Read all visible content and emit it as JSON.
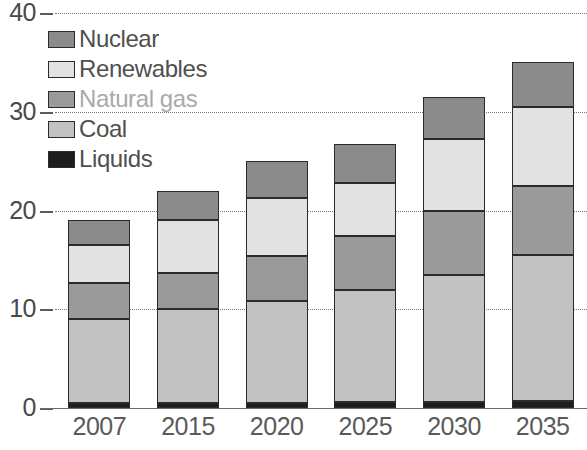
{
  "chart_data": {
    "type": "bar",
    "stacked": true,
    "title": "",
    "subtitle": "",
    "xlabel": "",
    "ylabel": "",
    "categories": [
      "2007",
      "2015",
      "2020",
      "2025",
      "2030",
      "2035"
    ],
    "ylim": [
      0,
      40
    ],
    "yticks": [
      0,
      10,
      20,
      30,
      40
    ],
    "ytick_labels": [
      "0",
      "10",
      "20",
      "30",
      "40"
    ],
    "grid": "horizontal-dotted",
    "legend_position": "upper-left",
    "series": [
      {
        "name": "Liquids",
        "color": "#1d1d1d",
        "values": [
          0.5,
          0.5,
          0.5,
          0.6,
          0.6,
          0.7
        ]
      },
      {
        "name": "Coal",
        "color": "#c2c2c2",
        "values": [
          8.5,
          9.5,
          10.3,
          11.4,
          12.9,
          14.8
        ]
      },
      {
        "name": "Natural gas",
        "color": "#9a9a9a",
        "values": [
          3.7,
          3.7,
          4.6,
          5.4,
          6.5,
          7.0
        ]
      },
      {
        "name": "Renewables",
        "color": "#e2e2e2",
        "values": [
          3.8,
          5.3,
          5.9,
          5.4,
          7.2,
          8.0
        ]
      },
      {
        "name": "Nuclear",
        "color": "#8b8b8b",
        "values": [
          2.5,
          3.0,
          3.7,
          3.9,
          4.3,
          4.5
        ]
      }
    ],
    "totals": [
      19.0,
      22.0,
      25.0,
      26.7,
      31.5,
      35.0
    ],
    "legend_entries": [
      {
        "label": "Nuclear",
        "color": "#8b8b8b",
        "faded_text": false
      },
      {
        "label": "Renewables",
        "color": "#e2e2e2",
        "faded_text": false
      },
      {
        "label": "Natural gas",
        "color": "#9a9a9a",
        "faded_text": true
      },
      {
        "label": "Coal",
        "color": "#c2c2c2",
        "faded_text": false
      },
      {
        "label": "Liquids",
        "color": "#1d1d1d",
        "faded_text": false
      }
    ]
  }
}
